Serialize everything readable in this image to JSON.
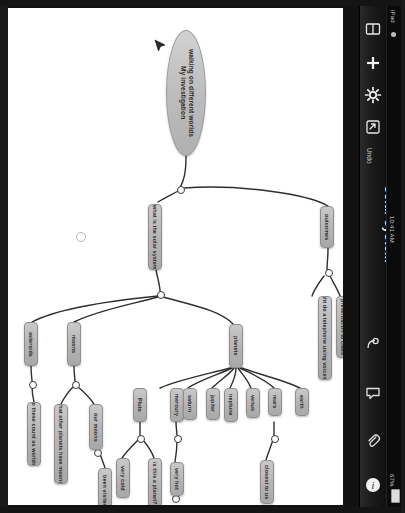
{
  "device": {
    "status_left": "iPad",
    "status_time": "10:41 AM",
    "status_battery": "67%",
    "wifi_icon": "wifi-icon"
  },
  "navbar": {
    "title": "solar system",
    "undo_label": "Undo",
    "icons": [
      {
        "name": "library-icon",
        "glyph": "book"
      },
      {
        "name": "add-popplet-icon",
        "glyph": "plus"
      },
      {
        "name": "settings-icon",
        "glyph": "gear"
      },
      {
        "name": "export-icon",
        "glyph": "export"
      },
      {
        "name": "present-icon",
        "glyph": "present"
      },
      {
        "name": "comment-icon",
        "glyph": "comment"
      },
      {
        "name": "share-icon",
        "glyph": "paperclip"
      },
      {
        "name": "info-icon",
        "glyph": "info"
      }
    ]
  },
  "mindmap": {
    "central": {
      "line1": "My investigation",
      "line2": "walking on different worlds"
    },
    "nodes": [
      {
        "id": "what-is-solar-system",
        "label": "what is the solar system"
      },
      {
        "id": "outcomes",
        "label": "outcomes"
      },
      {
        "id": "might-do-telephone",
        "label": "might do a telephone using voicemail"
      },
      {
        "id": "presentation-to-class",
        "label": "presentation to class"
      },
      {
        "id": "asteroids",
        "label": "asteroids"
      },
      {
        "id": "moons",
        "label": "moons"
      },
      {
        "id": "planets",
        "label": "planets"
      },
      {
        "id": "do-these-count",
        "label": "do these count as worlds?"
      },
      {
        "id": "what-other-planets-have-moons",
        "label": "what other planets have moons?"
      },
      {
        "id": "our-moons",
        "label": "our moons"
      },
      {
        "id": "been-visited",
        "label": "been visited"
      },
      {
        "id": "pluto",
        "label": "Pluto"
      },
      {
        "id": "very-cold",
        "label": "very cold"
      },
      {
        "id": "is-this-a-planet",
        "label": "is this a planet?"
      },
      {
        "id": "mercury",
        "label": "mercury"
      },
      {
        "id": "very-hot",
        "label": "very hot"
      },
      {
        "id": "saturn",
        "label": "saturn"
      },
      {
        "id": "jupiter",
        "label": "jupiter"
      },
      {
        "id": "neptune",
        "label": "neptune"
      },
      {
        "id": "venus",
        "label": "venus"
      },
      {
        "id": "mars",
        "label": "mars"
      },
      {
        "id": "earth",
        "label": "earth"
      },
      {
        "id": "closest-to-us",
        "label": "closest to us"
      }
    ]
  },
  "colors": {
    "node_fill": "#b4b4b4",
    "node_border": "#8e8e8e",
    "canvas": "#ffffff",
    "chrome": "#1c1c1c"
  }
}
